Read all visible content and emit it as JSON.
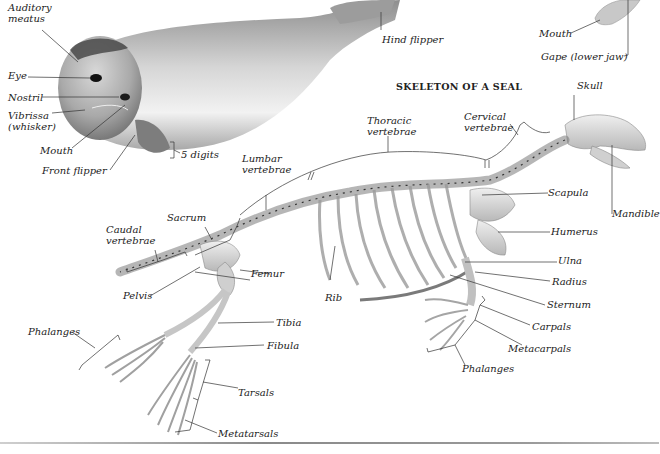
{
  "figure": {
    "title": "SKELETON OF A SEAL",
    "colors": {
      "background": "#ffffff",
      "label_text": "#222222",
      "leader_lines": "#333333",
      "seal_body": "#b9b9b9",
      "seal_dark": "#5a5a5a",
      "bone": "#d8d8d8"
    }
  },
  "seal_labels": {
    "auditory_meatus": "Auditory\nmeatus",
    "eye": "Eye",
    "nostril": "Nostril",
    "vibrissa": "Vibrissa\n(whisker)",
    "mouth": "Mouth",
    "front_flipper": "Front flipper",
    "digits": "5 digits",
    "hind_flipper": "Hind flipper"
  },
  "inset_labels": {
    "mouth": "Mouth",
    "gape": "Gape (lower jaw)"
  },
  "skeleton_labels": {
    "skull": "Skull",
    "cervical": "Cervical\nvertebrae",
    "thoracic": "Thoracic\nvertebrae",
    "lumbar": "Lumbar\nvertebrae",
    "sacrum": "Sacrum",
    "caudal": "Caudal\nvertebrae",
    "scapula": "Scapula",
    "mandible": "Mandible",
    "humerus": "Humerus",
    "ulna": "Ulna",
    "radius": "Radius",
    "sternum": "Sternum",
    "carpals": "Carpals",
    "metacarpals": "Metacarpals",
    "fore_phalanges": "Phalanges",
    "femur": "Femur",
    "pelvis": "Pelvis",
    "rib": "Rib",
    "tibia": "Tibia",
    "fibula": "Fibula",
    "hind_phalanges": "Phalanges",
    "tarsals": "Tarsals",
    "metatarsals": "Metatarsals"
  }
}
